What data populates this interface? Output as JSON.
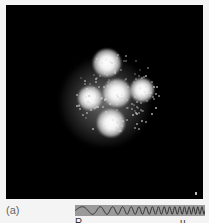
{
  "figure": {
    "panel_label": "(a)",
    "spots": [
      {
        "name": "top",
        "x": 101,
        "y": 58,
        "r": 11
      },
      {
        "name": "center",
        "x": 111,
        "y": 88,
        "r": 11
      },
      {
        "name": "right",
        "x": 136,
        "y": 85,
        "r": 9
      },
      {
        "name": "left",
        "x": 84,
        "y": 93,
        "r": 9
      },
      {
        "name": "bottom",
        "x": 105,
        "y": 118,
        "r": 11
      }
    ],
    "colors": {
      "panel_background": "#000000",
      "page_background": "#f4f4f4",
      "spot": "#ffffff",
      "chirp_background": "#9a9a9a"
    },
    "chirp_strip": {
      "type": "chirp-waveform",
      "cut_off_text": "R . . u . . u . . . X . . . Q"
    }
  }
}
